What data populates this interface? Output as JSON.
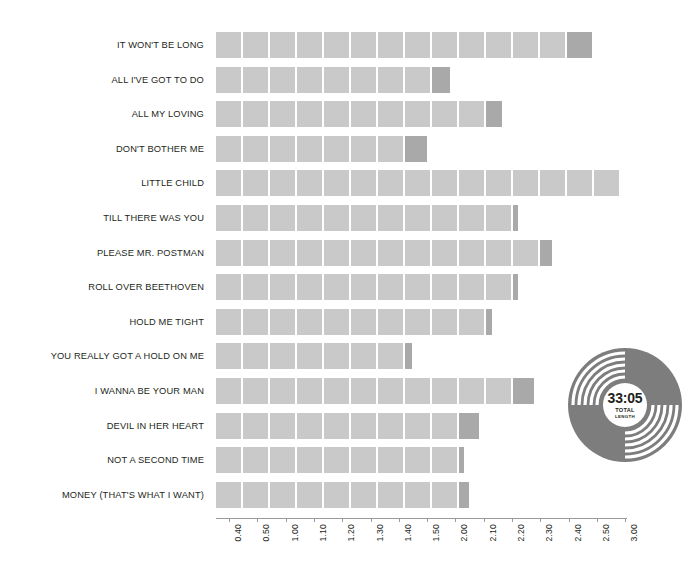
{
  "chart_data": {
    "type": "bar",
    "orientation": "horizontal",
    "title": "",
    "subtitle": "",
    "xlabel": "",
    "ylabel": "",
    "grid": false,
    "legend": false,
    "xlim": [
      "0.40",
      "3.00"
    ],
    "tick_labels": [
      "0.40",
      "0.50",
      "1.00",
      "1.10",
      "1.20",
      "1.30",
      "1.40",
      "1.50",
      "2.00",
      "2.10",
      "2.20",
      "2.30",
      "2.40",
      "2.50",
      "3.00"
    ],
    "categories": [
      "IT WON'T BE LONG",
      "ALL I'VE GOT TO DO",
      "ALL MY LOVING",
      "DON'T BOTHER ME",
      "LITTLE CHILD",
      "TILL THERE WAS YOU",
      "PLEASE MR. POSTMAN",
      "ROLL OVER BEETHOVEN",
      "HOLD ME TIGHT",
      "YOU REALLY GOT A HOLD ON ME",
      "I WANNA BE YOUR MAN",
      "DEVIL IN HER HEART",
      "NOT A SECOND TIME",
      "MONEY (THAT'S WHAT I WANT)"
    ],
    "values": [
      "2.50",
      "2.00",
      "2.30",
      "1.50",
      "3.00",
      "2.20",
      "2.40",
      "2.30",
      "2.10",
      "1.40",
      "2.30",
      "2.10",
      "2.00",
      "2.10"
    ],
    "bars": [
      {
        "label": "IT WON'T BE LONG",
        "value": "2.50",
        "full_segments": 13,
        "tail_width": 25
      },
      {
        "label": "ALL I'VE GOT TO DO",
        "value": "2.00",
        "full_segments": 8,
        "tail_width": 18
      },
      {
        "label": "ALL MY LOVING",
        "value": "2.30",
        "full_segments": 10,
        "tail_width": 16
      },
      {
        "label": "DON'T BOTHER ME",
        "value": "1.50",
        "full_segments": 7,
        "tail_width": 22
      },
      {
        "label": "LITTLE CHILD",
        "value": "3.00",
        "full_segments": 15,
        "tail_width": 0
      },
      {
        "label": "TILL THERE WAS YOU",
        "value": "2.20",
        "full_segments": 11,
        "tail_width": 5
      },
      {
        "label": "PLEASE MR. POSTMAN",
        "value": "2.40",
        "full_segments": 12,
        "tail_width": 12
      },
      {
        "label": "ROLL OVER BEETHOVEN",
        "value": "2.30",
        "full_segments": 11,
        "tail_width": 5
      },
      {
        "label": "HOLD ME TIGHT",
        "value": "2.10",
        "full_segments": 10,
        "tail_width": 6
      },
      {
        "label": "YOU REALLY GOT A HOLD ON ME",
        "value": "1.40",
        "full_segments": 7,
        "tail_width": 7
      },
      {
        "label": "I WANNA BE YOUR MAN",
        "value": "2.30",
        "full_segments": 11,
        "tail_width": 21
      },
      {
        "label": "DEVIL IN HER HEART",
        "value": "2.10",
        "full_segments": 9,
        "tail_width": 20
      },
      {
        "label": "NOT A SECOND TIME",
        "value": "2.00",
        "full_segments": 9,
        "tail_width": 5
      },
      {
        "label": "MONEY (THAT'S WHAT I WANT)",
        "value": "2.10",
        "full_segments": 9,
        "tail_width": 10
      }
    ],
    "annotation": {
      "total_length": "33:05",
      "caption_line1": "TOTAL",
      "caption_line2": "LENGTH"
    },
    "colors": {
      "segment": "#c9c9c9",
      "segment_tail": "#a9a9a9",
      "axis": "#9a9a9a",
      "text": "#231f20",
      "vinyl": "#7d7d7d",
      "background": "#ffffff"
    }
  }
}
